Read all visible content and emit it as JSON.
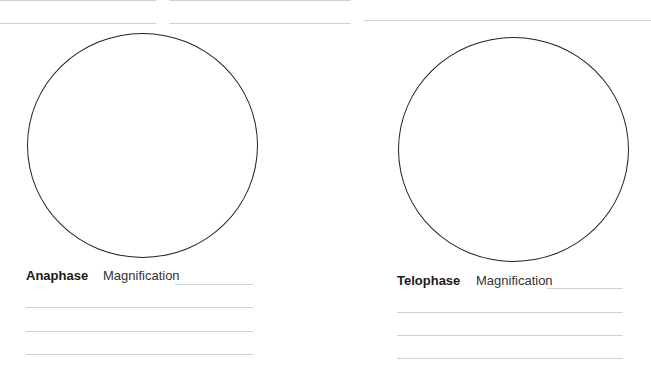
{
  "panels": [
    {
      "phase": "Anaphase",
      "magnification_label": "Magnification",
      "magnification_value": ""
    },
    {
      "phase": "Telophase",
      "magnification_label": "Magnification",
      "magnification_value": ""
    }
  ],
  "colors": {
    "line": "#cfcfcf",
    "circle": "#222222",
    "text": "#1a1a1a"
  }
}
